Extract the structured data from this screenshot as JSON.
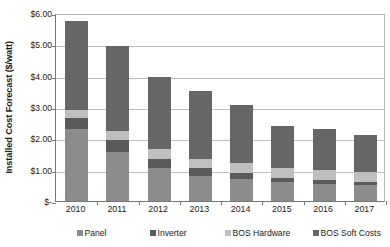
{
  "chart_data": {
    "type": "bar",
    "subtype": "stacked-column",
    "title": "",
    "xlabel": "",
    "ylabel": "Installed Cost Forecast ($/watt)",
    "categories": [
      "2010",
      "2011",
      "2012",
      "2013",
      "2014",
      "2015",
      "2016",
      "2017"
    ],
    "series": [
      {
        "name": "Panel",
        "color": "#8c8c8c",
        "values": [
          2.3,
          1.55,
          1.05,
          0.8,
          0.7,
          0.6,
          0.55,
          0.5
        ]
      },
      {
        "name": "Inverter",
        "color": "#5a5a5a",
        "values": [
          0.35,
          0.4,
          0.3,
          0.25,
          0.2,
          0.12,
          0.12,
          0.12
        ]
      },
      {
        "name": "BOS Hardware",
        "color": "#bfbfbf",
        "values": [
          0.25,
          0.3,
          0.3,
          0.3,
          0.3,
          0.33,
          0.33,
          0.3
        ]
      },
      {
        "name": "BOS Soft Costs",
        "color": "#666666",
        "values": [
          2.85,
          2.7,
          2.3,
          2.15,
          1.85,
          1.35,
          1.3,
          1.18
        ]
      }
    ],
    "totals": [
      5.75,
      4.95,
      3.95,
      3.5,
      3.05,
      2.4,
      2.3,
      2.1
    ],
    "ylim": [
      0,
      6
    ],
    "ytick_values": [
      0,
      1,
      2,
      3,
      4,
      5,
      6
    ],
    "ytick_labels": [
      "$-",
      "$1.00",
      "$2.00",
      "$3.00",
      "$4.00",
      "$5.00",
      "$6.00"
    ],
    "grid": true,
    "grid_axis": "y",
    "legend_position": "bottom",
    "legend": [
      "Panel",
      "Inverter",
      "BOS Hardware",
      "BOS Soft Costs"
    ],
    "axis_color": "#777777",
    "grid_color": "#bdbdbd",
    "plot_background": "#ffffff"
  }
}
